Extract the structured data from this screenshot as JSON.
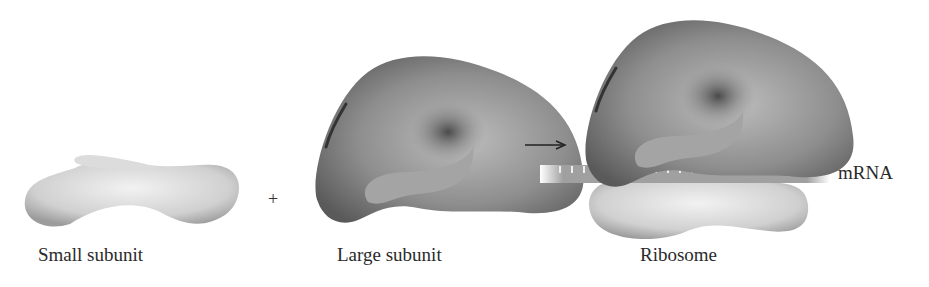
{
  "figure": {
    "labels": {
      "small_subunit": "Small subunit",
      "large_subunit": "Large subunit",
      "ribosome": "Ribosome",
      "mrna": "mRNA",
      "plus": "+"
    },
    "colors": {
      "small_subunit_fill": "#d6d6d6",
      "large_subunit_fill": "#8a8a8a",
      "mrna_fill": "#9a9a9a",
      "text": "#2a2a2a"
    }
  }
}
